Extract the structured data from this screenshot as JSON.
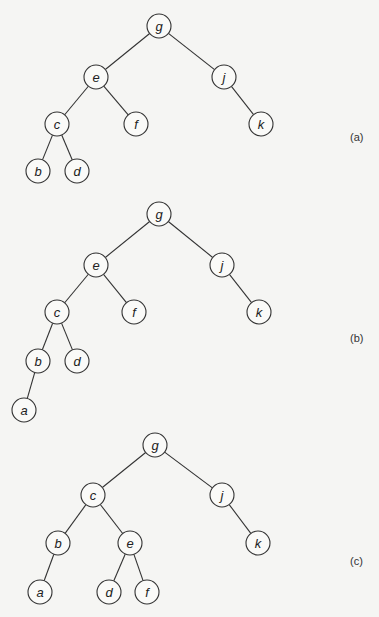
{
  "diagram": {
    "type": "binary-tree-rotation",
    "node_radius": 12,
    "panels": [
      {
        "id": "a",
        "label": "(a)",
        "label_pos": [
          350,
          131
        ],
        "nodes": [
          {
            "id": "g",
            "x": 159,
            "y": 26
          },
          {
            "id": "e",
            "x": 96,
            "y": 77
          },
          {
            "id": "j",
            "x": 224,
            "y": 77
          },
          {
            "id": "c",
            "x": 57,
            "y": 124
          },
          {
            "id": "f",
            "x": 136,
            "y": 124
          },
          {
            "id": "k",
            "x": 261,
            "y": 124
          },
          {
            "id": "b",
            "x": 38,
            "y": 171
          },
          {
            "id": "d",
            "x": 77,
            "y": 171
          }
        ],
        "edges": [
          [
            "g",
            "e"
          ],
          [
            "g",
            "j"
          ],
          [
            "e",
            "c"
          ],
          [
            "e",
            "f"
          ],
          [
            "j",
            "k"
          ],
          [
            "c",
            "b"
          ],
          [
            "c",
            "d"
          ]
        ]
      },
      {
        "id": "b",
        "label": "(b)",
        "label_pos": [
          350,
          332
        ],
        "nodes": [
          {
            "id": "g",
            "x": 159,
            "y": 214
          },
          {
            "id": "e",
            "x": 96,
            "y": 265
          },
          {
            "id": "j",
            "x": 222,
            "y": 265
          },
          {
            "id": "c",
            "x": 57,
            "y": 312
          },
          {
            "id": "f",
            "x": 134,
            "y": 312
          },
          {
            "id": "k",
            "x": 259,
            "y": 312
          },
          {
            "id": "b",
            "x": 38,
            "y": 361
          },
          {
            "id": "d",
            "x": 77,
            "y": 361
          },
          {
            "id": "a",
            "x": 24,
            "y": 410
          }
        ],
        "edges": [
          [
            "g",
            "e"
          ],
          [
            "g",
            "j"
          ],
          [
            "e",
            "c"
          ],
          [
            "e",
            "f"
          ],
          [
            "j",
            "k"
          ],
          [
            "c",
            "b"
          ],
          [
            "c",
            "d"
          ],
          [
            "b",
            "a"
          ]
        ]
      },
      {
        "id": "c",
        "label": "(c)",
        "label_pos": [
          350,
          555
        ],
        "nodes": [
          {
            "id": "g",
            "x": 155,
            "y": 445
          },
          {
            "id": "c",
            "x": 93,
            "y": 495
          },
          {
            "id": "j",
            "x": 222,
            "y": 495
          },
          {
            "id": "b",
            "x": 58,
            "y": 543
          },
          {
            "id": "e",
            "x": 130,
            "y": 543
          },
          {
            "id": "k",
            "x": 258,
            "y": 543
          },
          {
            "id": "a",
            "x": 40,
            "y": 592
          },
          {
            "id": "d",
            "x": 109,
            "y": 592
          },
          {
            "id": "f",
            "x": 147,
            "y": 592
          }
        ],
        "edges": [
          [
            "g",
            "c"
          ],
          [
            "g",
            "j"
          ],
          [
            "c",
            "b"
          ],
          [
            "c",
            "e"
          ],
          [
            "j",
            "k"
          ],
          [
            "b",
            "a"
          ],
          [
            "e",
            "d"
          ],
          [
            "e",
            "f"
          ]
        ]
      }
    ]
  }
}
